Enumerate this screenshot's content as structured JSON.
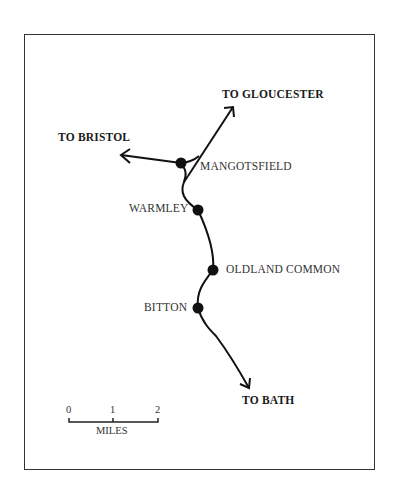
{
  "map": {
    "destinations": {
      "gloucester": "TO GLOUCESTER",
      "bristol": "TO BRISTOL",
      "bath": "TO BATH"
    },
    "stations": [
      {
        "name": "MANGOTSFIELD"
      },
      {
        "name": "WARMLEY"
      },
      {
        "name": "OLDLAND COMMON"
      },
      {
        "name": "BITTON"
      }
    ],
    "scale": {
      "ticks": [
        "0",
        "1",
        "2"
      ],
      "unit": "MILES"
    },
    "colors": {
      "line": "#111111",
      "frame": "#333333",
      "background": "#ffffff"
    }
  }
}
